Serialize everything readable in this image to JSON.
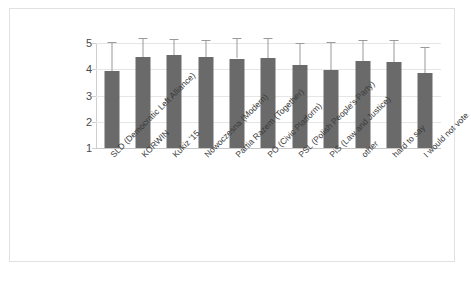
{
  "chart_data": {
    "type": "bar",
    "title": "",
    "subtitle": "",
    "xlabel": "",
    "ylabel": "",
    "ylim": [
      1,
      5
    ],
    "yticks": [
      1,
      2,
      3,
      4,
      5
    ],
    "ytick_labels": [
      "1",
      "2",
      "3",
      "4",
      "5"
    ],
    "grid": true,
    "legend": "none",
    "bar_color": "#6a6a6a",
    "error_bar_color": "#9a9a9a",
    "gridline_color": "#e6e6e6",
    "categories": [
      "SLD (Democratic Left Alliance)",
      "KORWIN",
      "Kukiz '15",
      "Nowoczesna (Modern)",
      "Partia Razem (Together)",
      "PO (Civic Platform)",
      "PSL (Polish People's Party)",
      "PiS (Law and Justice)",
      "other",
      "hard to say",
      "I would not vote"
    ],
    "values": [
      3.93,
      4.46,
      4.54,
      4.46,
      4.41,
      4.42,
      4.18,
      3.98,
      4.32,
      4.27,
      3.86
    ],
    "error_upper": [
      5.05,
      5.2,
      5.15,
      5.13,
      5.2,
      5.18,
      5.0,
      5.02,
      5.1,
      5.12,
      4.85
    ],
    "series": [
      {
        "name": "mean rating",
        "values": [
          3.93,
          4.46,
          4.54,
          4.46,
          4.41,
          4.42,
          4.18,
          3.98,
          4.32,
          4.27,
          3.86
        ]
      }
    ]
  }
}
